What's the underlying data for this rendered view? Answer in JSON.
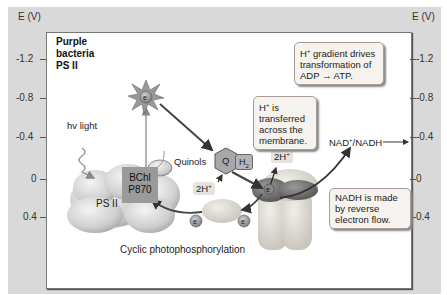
{
  "diagram": {
    "title_lines": [
      "Purple",
      "bacteria",
      "PS II"
    ],
    "axis": {
      "left_title": "E (V)",
      "right_title": "E (V)",
      "ticks": [
        "-1.2",
        "-0.8",
        "-0.4",
        "0",
        "0.4"
      ]
    },
    "labels": {
      "light": "hv light",
      "bchl_line1": "BChl",
      "bchl_line2": "P870",
      "ps2": "PS II",
      "quinols": "Quinols",
      "q": "Q",
      "h2": "H2",
      "two_h_lower": "2H+",
      "two_h_upper": "2H+",
      "electron": "e-",
      "nad": "NAD+/NADH",
      "cyclic": "Cyclic photophosphorylation"
    },
    "callouts": {
      "gradient": [
        "H+ gradient drives",
        "transformation of",
        "ADP → ATP."
      ],
      "transfer": [
        "H+ is",
        "transferred",
        "across the",
        "membrane."
      ],
      "nadh": [
        "NADH is made",
        "by reverse",
        "electron flow."
      ]
    }
  }
}
